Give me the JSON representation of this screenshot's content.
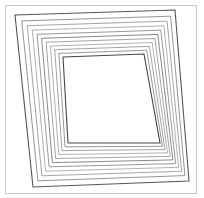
{
  "figure": {
    "frame_color": "#c8c8c8",
    "background": "#ffffff",
    "layer_count": 11,
    "outer_corners": [
      [
        15,
        15
      ],
      [
        175,
        10
      ],
      [
        189,
        181
      ],
      [
        33,
        187
      ]
    ],
    "inner_corners": [
      [
        63,
        57
      ],
      [
        144,
        54
      ],
      [
        160,
        143
      ],
      [
        68,
        143
      ]
    ],
    "stroke_colors": [
      "#555555",
      "#8a8a8a",
      "#9a9a9a",
      "#a8a8a8",
      "#8c8c8c",
      "#7a7a7a",
      "#9a9a9a",
      "#a8a8a8",
      "#9a9a9a",
      "#8a8a8a",
      "#444444"
    ]
  }
}
